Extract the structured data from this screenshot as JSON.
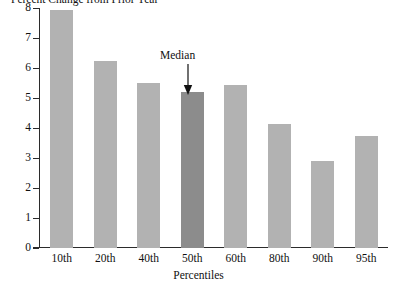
{
  "chart_data": {
    "type": "bar",
    "title": "Percent Change from Prior Year",
    "xlabel": "Percentiles",
    "ylabel": "",
    "categories": [
      "10th",
      "20th",
      "40th",
      "50th",
      "60th",
      "80th",
      "90th",
      "95th"
    ],
    "values": [
      7.95,
      6.25,
      5.5,
      5.2,
      5.45,
      4.15,
      2.9,
      3.75
    ],
    "ylim": [
      0,
      8
    ],
    "yticks": [
      0,
      1,
      2,
      3,
      4,
      5,
      6,
      7,
      8
    ],
    "ytick_labels": [
      "0",
      "1",
      "2",
      "3",
      "4",
      "5",
      "6",
      "7",
      "8"
    ],
    "grid": false,
    "legend": "none",
    "annotations": [
      {
        "text": "Median",
        "target_category": "50th",
        "style": "arrow-down"
      }
    ],
    "series_colors": {
      "bar": "#b2b2b2",
      "highlight_bar": "#8c8c8c",
      "axis": "#2b2b2b",
      "text": "#111111"
    }
  }
}
